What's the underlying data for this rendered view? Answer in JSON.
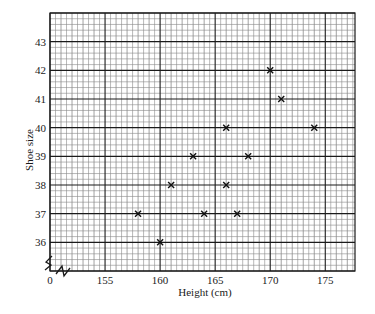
{
  "chart_data": {
    "type": "scatter",
    "title": "",
    "xlabel": "Height (cm)",
    "ylabel": "Shoe size",
    "x_ticks": [
      "0",
      "155",
      "160",
      "165",
      "170",
      "175"
    ],
    "y_ticks": [
      "36",
      "37",
      "38",
      "39",
      "40",
      "41",
      "42",
      "43"
    ],
    "xlim": [
      150,
      177.7
    ],
    "ylim": [
      35,
      44
    ],
    "x_axis_break": true,
    "y_axis_break": true,
    "grid": true,
    "grid_minor_step_x": 0.5,
    "grid_minor_step_y": 0.2,
    "marker": "x",
    "series": [
      {
        "name": "Height vs Shoe size",
        "points": [
          {
            "x": 158,
            "y": 37
          },
          {
            "x": 160,
            "y": 36
          },
          {
            "x": 161,
            "y": 38
          },
          {
            "x": 163,
            "y": 39
          },
          {
            "x": 164,
            "y": 37
          },
          {
            "x": 166,
            "y": 38
          },
          {
            "x": 166,
            "y": 40
          },
          {
            "x": 167,
            "y": 37
          },
          {
            "x": 168,
            "y": 39
          },
          {
            "x": 170,
            "y": 42
          },
          {
            "x": 171,
            "y": 41
          },
          {
            "x": 174,
            "y": 40
          }
        ]
      }
    ],
    "colors": {
      "grid_major": "#1a1a1a",
      "grid_minor": "#8a8a8a",
      "marker": "#111111"
    }
  }
}
